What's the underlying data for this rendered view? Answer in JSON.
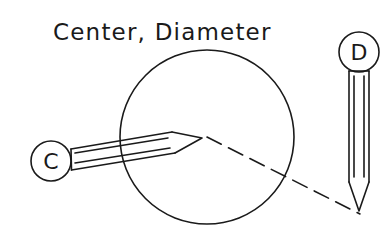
{
  "title": "Center, Diameter",
  "circle": {
    "cx": 207,
    "cy": 137,
    "r": 87
  },
  "pencils": [
    {
      "id": "center",
      "label": "C",
      "role": "center point pick"
    },
    {
      "id": "diameter",
      "label": "D",
      "role": "diameter point pick"
    }
  ],
  "dashed_line": {
    "from": [
      207,
      137
    ],
    "to": [
      360,
      214
    ],
    "dash": "16 8"
  },
  "colors": {
    "stroke": "#1a1a1a",
    "background": "#ffffff"
  }
}
